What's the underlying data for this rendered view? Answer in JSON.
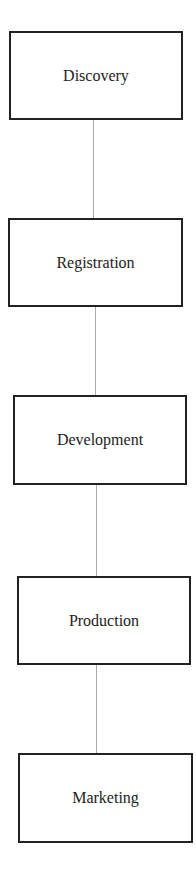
{
  "diagram": {
    "type": "vertical-flow",
    "nodes": [
      {
        "id": "discovery",
        "label": "Discovery"
      },
      {
        "id": "registration",
        "label": "Registration"
      },
      {
        "id": "development",
        "label": "Development"
      },
      {
        "id": "production",
        "label": "Production"
      },
      {
        "id": "marketing",
        "label": "Marketing"
      }
    ],
    "edges": [
      {
        "from": "discovery",
        "to": "registration"
      },
      {
        "from": "registration",
        "to": "development"
      },
      {
        "from": "development",
        "to": "production"
      },
      {
        "from": "production",
        "to": "marketing"
      }
    ]
  }
}
